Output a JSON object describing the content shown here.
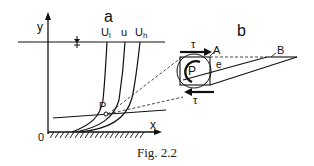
{
  "figure": {
    "caption": "Fig. 2.2",
    "panel_a": {
      "label": "a",
      "y_axis": "y",
      "x_axis": "x",
      "origin": "0",
      "curves": [
        "U",
        "u",
        "U"
      ],
      "curve_subscripts": [
        "l",
        "",
        "h"
      ],
      "point": "P",
      "water_surface_symbol": "water-level-marker"
    },
    "panel_b": {
      "label": "b",
      "top_stress": "τ",
      "bottom_stress": "τ",
      "point": "P",
      "corner_a": "A",
      "corner_b": "B",
      "angle": "e"
    }
  },
  "colors": {
    "ink": "#111111",
    "background": "#ffffff"
  }
}
